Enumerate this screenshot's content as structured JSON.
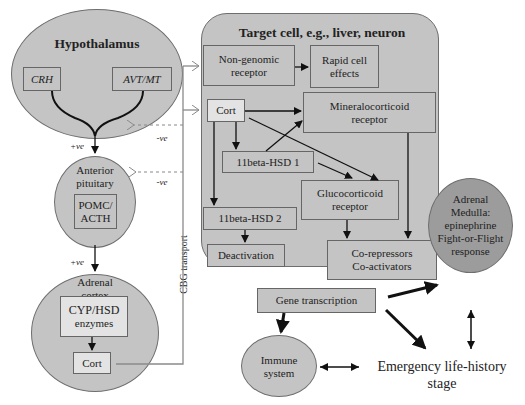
{
  "colors": {
    "node_fill": "#c4c4c4",
    "light_fill": "#e3e3e3",
    "dark_node_fill": "#9c9c9c",
    "border": "#666666",
    "arrow": "#111111",
    "transport_line": "#8a8a8a"
  },
  "hypothalamus": {
    "title": "Hypothalamus",
    "crh": "CRH",
    "avt_mt": "AVT/MT",
    "effect": "+ve"
  },
  "anterior_pituitary": {
    "title_line1": "Anterior",
    "title_line2": "pituitary",
    "box_line1": "POMC/",
    "box_line2": "ACTH",
    "effect": "+ve",
    "feedback": "-ve"
  },
  "adrenal_cortex": {
    "title_line1": "Adrenal",
    "title_line2": "cortex",
    "enzymes_line1": "CYP/HSD",
    "enzymes_line2": "enzymes",
    "cort": "Cort"
  },
  "transport": {
    "label": "CBG transport",
    "hypothalamus_feedback": "-ve"
  },
  "target_cell": {
    "title": "Target cell, e.g., liver, neuron",
    "non_genomic_line1": "Non-genomic",
    "non_genomic_line2": "receptor",
    "rapid_line1": "Rapid cell",
    "rapid_line2": "effects",
    "cort": "Cort",
    "mineralocorticoid_line1": "Mineralocorticoid",
    "mineralocorticoid_line2": "receptor",
    "hsd1": "11beta-HSD 1",
    "glucocorticoid_line1": "Glucocorticoid",
    "glucocorticoid_line2": "receptor",
    "hsd2": "11beta-HSD 2",
    "deactivation": "Deactivation",
    "coreg_line1": "Co-repressors",
    "coreg_line2": "Co-activators",
    "gene_transcription": "Gene transcription"
  },
  "adrenal_medulla": {
    "line1": "Adrenal",
    "line2": "Medulla:",
    "line3": "epinephrine",
    "line4": "Fight-or-Flight",
    "line5": "response"
  },
  "immune_system": {
    "line1": "Immune",
    "line2": "system"
  },
  "emergency": {
    "line1": "Emergency life-history",
    "line2": "stage"
  }
}
